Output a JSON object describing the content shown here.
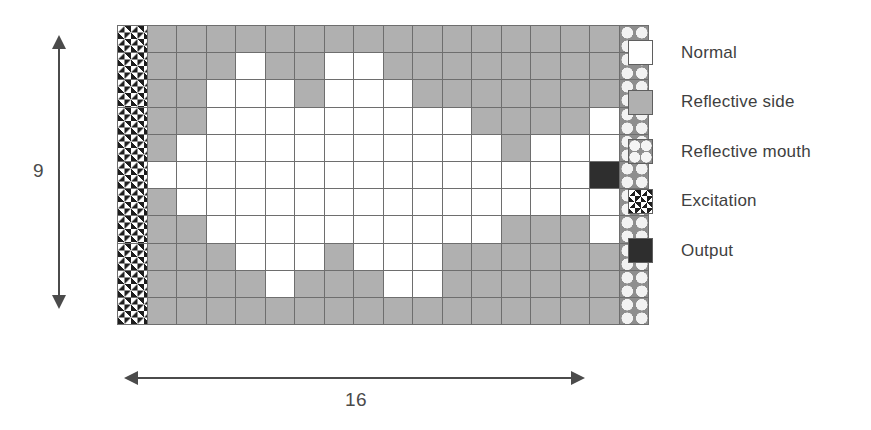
{
  "diagram": {
    "title": "",
    "dimensions": {
      "width_label": "16",
      "height_label": "9",
      "width_arrow": "horizontal-double-arrow",
      "height_arrow": "vertical-double-arrow"
    },
    "colors": {
      "normal": "#ffffff",
      "reflective_side": "#b0b0b0",
      "reflective_mouth": "#8e8e8e",
      "excitation": "#1e1e1e",
      "output": "#2e2e2e",
      "grid_line": "#6e6e6e",
      "arrow": "#4b4b4b",
      "text": "#3f3f3f"
    },
    "grid": {
      "rows": 11,
      "cols": 18,
      "legend_key": {
        "N": "normal",
        "S": "side",
        "M": "mouth",
        "E": "excite",
        "O": "output"
      },
      "cells": [
        [
          "E",
          "S",
          "S",
          "S",
          "S",
          "S",
          "S",
          "S",
          "S",
          "S",
          "S",
          "S",
          "S",
          "S",
          "S",
          "S",
          "S",
          "M"
        ],
        [
          "E",
          "S",
          "S",
          "S",
          "N",
          "S",
          "S",
          "N",
          "N",
          "S",
          "S",
          "S",
          "S",
          "S",
          "S",
          "S",
          "S",
          "M"
        ],
        [
          "E",
          "S",
          "S",
          "N",
          "N",
          "N",
          "S",
          "N",
          "N",
          "N",
          "S",
          "S",
          "S",
          "S",
          "S",
          "S",
          "S",
          "M"
        ],
        [
          "E",
          "S",
          "S",
          "N",
          "N",
          "N",
          "N",
          "N",
          "N",
          "N",
          "N",
          "N",
          "S",
          "S",
          "S",
          "S",
          "N",
          "M"
        ],
        [
          "E",
          "S",
          "N",
          "N",
          "N",
          "N",
          "N",
          "N",
          "N",
          "N",
          "N",
          "N",
          "N",
          "S",
          "N",
          "N",
          "N",
          "M"
        ],
        [
          "E",
          "N",
          "N",
          "N",
          "N",
          "N",
          "N",
          "N",
          "N",
          "N",
          "N",
          "N",
          "N",
          "N",
          "N",
          "N",
          "O",
          "M"
        ],
        [
          "E",
          "S",
          "N",
          "N",
          "N",
          "N",
          "N",
          "N",
          "N",
          "N",
          "N",
          "N",
          "N",
          "N",
          "N",
          "N",
          "N",
          "M"
        ],
        [
          "E",
          "S",
          "S",
          "N",
          "N",
          "N",
          "N",
          "N",
          "N",
          "N",
          "N",
          "N",
          "N",
          "S",
          "S",
          "S",
          "N",
          "M"
        ],
        [
          "E",
          "S",
          "S",
          "S",
          "N",
          "N",
          "N",
          "S",
          "N",
          "N",
          "N",
          "S",
          "S",
          "S",
          "S",
          "S",
          "S",
          "M"
        ],
        [
          "E",
          "S",
          "S",
          "S",
          "S",
          "N",
          "S",
          "S",
          "S",
          "N",
          "N",
          "S",
          "S",
          "S",
          "S",
          "S",
          "S",
          "M"
        ],
        [
          "E",
          "S",
          "S",
          "S",
          "S",
          "S",
          "S",
          "S",
          "S",
          "S",
          "S",
          "S",
          "S",
          "S",
          "S",
          "S",
          "S",
          "M"
        ]
      ]
    },
    "legend": {
      "items": [
        {
          "swatch": "normal",
          "label": "Normal"
        },
        {
          "swatch": "side",
          "label": "Reflective side"
        },
        {
          "swatch": "mouth",
          "label": "Reflective mouth"
        },
        {
          "swatch": "excite",
          "label": "Excitation"
        },
        {
          "swatch": "output",
          "label": "Output"
        }
      ]
    }
  }
}
